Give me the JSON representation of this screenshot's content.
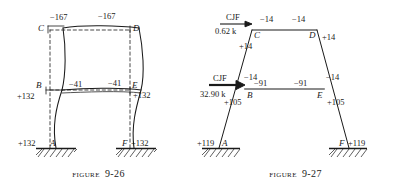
{
  "page": {
    "background": "#ffffff",
    "ink": "#1a1a1a",
    "beam_highlight": "#8c8c8c"
  },
  "figures": [
    {
      "id": "figure-9-26",
      "caption_word": "Figure",
      "caption_number": "9-26",
      "description": "Deflected shape of a two-story rigid frame with end moments",
      "joints": [
        {
          "name": "C",
          "label": "C"
        },
        {
          "name": "D",
          "label": "D"
        },
        {
          "name": "B",
          "label": "B"
        },
        {
          "name": "E",
          "label": "E"
        },
        {
          "name": "A",
          "label": "A"
        },
        {
          "name": "F",
          "label": "F"
        }
      ],
      "moments": [
        {
          "name": "top-left-beam",
          "value": "−167"
        },
        {
          "name": "top-right-beam",
          "value": "−167"
        },
        {
          "name": "mid-left-beam",
          "value": "−41"
        },
        {
          "name": "mid-right-beam",
          "value": "−41"
        },
        {
          "name": "left-column-mid",
          "value": "+132"
        },
        {
          "name": "right-column-mid",
          "value": "+132"
        },
        {
          "name": "left-base",
          "value": "+132"
        },
        {
          "name": "right-base",
          "value": "+132"
        }
      ]
    },
    {
      "id": "figure-9-27",
      "caption_word": "Figure",
      "caption_number": "9-27",
      "description": "Frame with column joint forces and resulting end moments",
      "joints": [
        {
          "name": "C",
          "label": "C"
        },
        {
          "name": "D",
          "label": "D"
        },
        {
          "name": "B",
          "label": "B"
        },
        {
          "name": "E",
          "label": "E"
        },
        {
          "name": "A",
          "label": "A"
        },
        {
          "name": "F",
          "label": "F"
        }
      ],
      "forces": [
        {
          "name": "upper-cjf",
          "label": "CJF",
          "magnitude": "0.62 k"
        },
        {
          "name": "lower-cjf",
          "label": "CJF",
          "magnitude": "32.90 k"
        }
      ],
      "moments": [
        {
          "name": "top-left-beam",
          "value": "−14"
        },
        {
          "name": "top-right-beam",
          "value": "−14"
        },
        {
          "name": "upper-left-column",
          "value": "+14"
        },
        {
          "name": "upper-right-column",
          "value": "+14"
        },
        {
          "name": "mid-left-outside",
          "value": "−14"
        },
        {
          "name": "mid-left-beam",
          "value": "−91"
        },
        {
          "name": "mid-right-beam",
          "value": "−91"
        },
        {
          "name": "mid-right-outside",
          "value": "−14"
        },
        {
          "name": "lower-left-column",
          "value": "+105"
        },
        {
          "name": "lower-right-column",
          "value": "+105"
        },
        {
          "name": "left-base",
          "value": "+119"
        },
        {
          "name": "right-base",
          "value": "+119"
        }
      ]
    }
  ]
}
